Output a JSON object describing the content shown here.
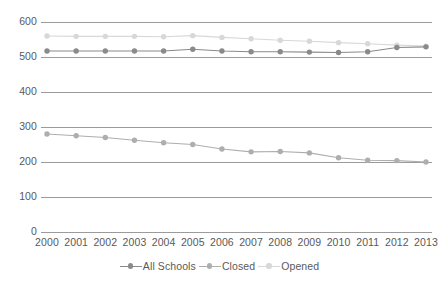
{
  "chart_data": {
    "type": "line",
    "title": "",
    "subtitle": "",
    "xlabel": "",
    "ylabel": "",
    "categories": [
      "2000",
      "2001",
      "2002",
      "2003",
      "2004",
      "2005",
      "2006",
      "2007",
      "2008",
      "2009",
      "2010",
      "2011",
      "2012",
      "2013"
    ],
    "ylim": [
      0,
      600
    ],
    "yticks": [
      0,
      100,
      200,
      300,
      400,
      500,
      600
    ],
    "ytick_labels": [
      "0",
      "100",
      "200",
      "300",
      "400",
      "500",
      "600"
    ],
    "grid": true,
    "legend_position": "bottom",
    "series": [
      {
        "name": "All Schools",
        "color": "#8a8a8a",
        "marker": "circle",
        "values": [
          517,
          517,
          517,
          517,
          517,
          522,
          517,
          515,
          515,
          514,
          513,
          515,
          527,
          529
        ]
      },
      {
        "name": "Closed",
        "color": "#aeaeae",
        "marker": "circle",
        "values": [
          280,
          275,
          270,
          262,
          255,
          250,
          237,
          229,
          230,
          226,
          212,
          205,
          204,
          200
        ]
      },
      {
        "name": "Opened",
        "color": "#d8d8d8",
        "marker": "circle",
        "values": [
          560,
          559,
          559,
          559,
          558,
          561,
          556,
          552,
          548,
          545,
          541,
          538,
          534,
          531
        ]
      }
    ]
  },
  "legend": {
    "entries": [
      {
        "label": "All Schools",
        "color": "#8a8a8a"
      },
      {
        "label": "Closed",
        "color": "#aeaeae"
      },
      {
        "label": "Opened",
        "color": "#d8d8d8"
      }
    ]
  },
  "axes": {
    "gridline_color": "#9b9b9b",
    "tick_text_color": "#595959"
  }
}
